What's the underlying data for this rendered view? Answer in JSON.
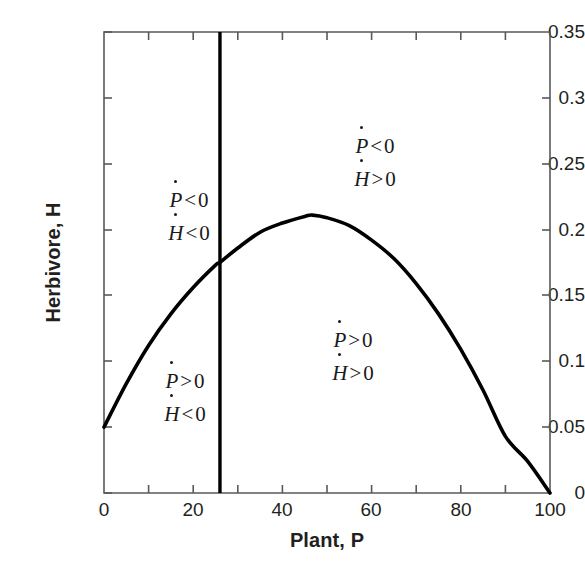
{
  "chart_data": {
    "type": "line",
    "title": "",
    "xlabel": "Plant, P",
    "ylabel": "Herbivore, H",
    "xlim": [
      0,
      100
    ],
    "ylim": [
      0,
      0.35
    ],
    "grid": false,
    "legend_position": "none",
    "xticks": [
      0,
      20,
      40,
      60,
      80,
      100
    ],
    "xtick_labels": [
      "0",
      "20",
      "40",
      "60",
      "80",
      "100"
    ],
    "x_minor_ticks": [
      10,
      30,
      50,
      70,
      90
    ],
    "yticks": [
      0,
      0.05,
      0.1,
      0.15,
      0.2,
      0.25,
      0.3,
      0.35
    ],
    "ytick_labels": [
      "0",
      "0.05",
      "0.1",
      "0.15",
      "0.2",
      "0.25",
      "0.3",
      "0.35"
    ],
    "series": [
      {
        "name": "H-nullcline (hump-shaped curve)",
        "type": "line",
        "color": "#000000",
        "x": [
          0,
          5,
          10,
          15,
          20,
          25,
          26,
          30,
          35,
          40,
          45,
          46.7,
          50,
          55,
          60,
          65,
          70,
          75,
          80,
          85,
          90,
          95,
          100
        ],
        "y": [
          0.05,
          0.083,
          0.112,
          0.136,
          0.156,
          0.173,
          0.175,
          0.186,
          0.198,
          0.205,
          0.21,
          0.211,
          0.209,
          0.203,
          0.192,
          0.178,
          0.159,
          0.136,
          0.109,
          0.078,
          0.043,
          0.024,
          0.0
        ]
      },
      {
        "name": "P-nullcline (vertical line)",
        "type": "vline",
        "color": "#000000",
        "x": [
          26,
          26
        ],
        "y": [
          0,
          0.35
        ]
      }
    ],
    "annotations": [
      {
        "id": "upper-left",
        "p_sign": "<",
        "h_sign": "<",
        "x": 15,
        "y": 0.233,
        "text": "Ṗ < 0, Ḣ < 0"
      },
      {
        "id": "upper-right",
        "p_sign": "<",
        "h_sign": ">",
        "x": 49,
        "y": 0.263,
        "text": "Ṗ < 0, Ḣ > 0"
      },
      {
        "id": "lower-left",
        "p_sign": ">",
        "h_sign": "<",
        "x": 14,
        "y": 0.068,
        "text": "Ṗ > 0, Ḣ < 0"
      },
      {
        "id": "lower-center",
        "p_sign": ">",
        "h_sign": ">",
        "x": 45,
        "y": 0.118,
        "text": "Ṗ > 0, Ḣ > 0"
      }
    ],
    "intersection": {
      "x": 26,
      "y": 0.185
    },
    "curve_peak": {
      "x": 46.7,
      "y": 0.213
    },
    "curve_intercepts": {
      "left_y": 0.05,
      "right_x": 100
    }
  },
  "axes": {
    "x_title": "Plant, P",
    "y_title": "Herbivore, H"
  },
  "regions": {
    "upper_left": {
      "line1_var": "P",
      "line1_rel": "<",
      "line1_num": "0",
      "line2_var": "H",
      "line2_rel": "<",
      "line2_num": "0"
    },
    "upper_right": {
      "line1_var": "P",
      "line1_rel": "<",
      "line1_num": "0",
      "line2_var": "H",
      "line2_rel": ">",
      "line2_num": "0"
    },
    "lower_left": {
      "line1_var": "P",
      "line1_rel": ">",
      "line1_num": "0",
      "line2_var": "H",
      "line2_rel": "<",
      "line2_num": "0"
    },
    "lower_center": {
      "line1_var": "P",
      "line1_rel": ">",
      "line1_num": "0",
      "line2_var": "H",
      "line2_rel": ">",
      "line2_num": "0"
    }
  },
  "colors": {
    "curve": "#000000",
    "axis": "#595959",
    "text": "#231f20",
    "background": "#ffffff"
  }
}
